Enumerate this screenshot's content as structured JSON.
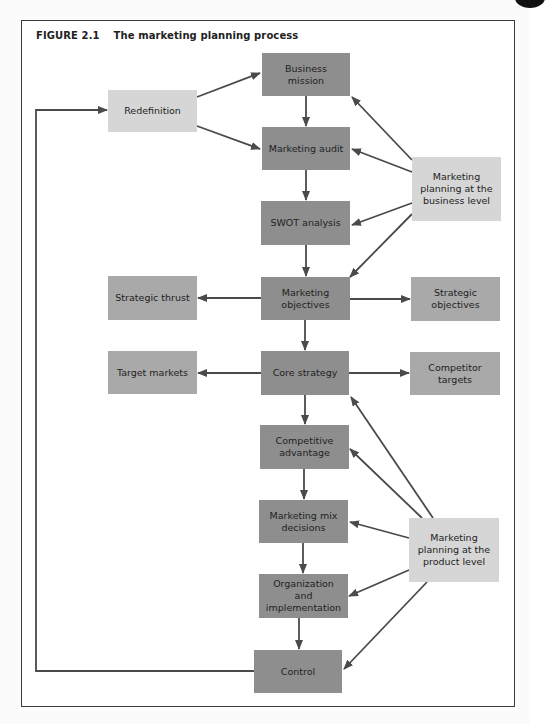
{
  "figure": {
    "number": "FIGURE 2.1",
    "title": "The marketing planning process"
  },
  "colors": {
    "core_box": "#8e8e8e",
    "side_box": "#a9a9a9",
    "light_box": "#d6d6d6",
    "arrow": "#4a4a4a",
    "frame": "#3a3a3a"
  },
  "nodes": {
    "business_mission": "Business mission",
    "marketing_audit": "Marketing audit",
    "swot_analysis": "SWOT analysis",
    "marketing_objectives": "Marketing objectives",
    "core_strategy": "Core strategy",
    "competitive_advantage": "Competitive advantage",
    "marketing_mix_decisions": "Marketing mix decisions",
    "organization_implementation": "Organization and implementation",
    "control": "Control",
    "redefinition": "Redefinition",
    "strategic_thrust": "Strategic thrust",
    "target_markets": "Target markets",
    "strategic_objectives": "Strategic objectives",
    "competitor_targets": "Competitor targets",
    "planning_business_level": "Marketing planning at the business level",
    "planning_product_level": "Marketing planning at the product level"
  },
  "edges": [
    {
      "from": "business_mission",
      "to": "marketing_audit"
    },
    {
      "from": "marketing_audit",
      "to": "swot_analysis"
    },
    {
      "from": "swot_analysis",
      "to": "marketing_objectives"
    },
    {
      "from": "marketing_objectives",
      "to": "core_strategy"
    },
    {
      "from": "core_strategy",
      "to": "competitive_advantage"
    },
    {
      "from": "competitive_advantage",
      "to": "marketing_mix_decisions"
    },
    {
      "from": "marketing_mix_decisions",
      "to": "organization_implementation"
    },
    {
      "from": "organization_implementation",
      "to": "control"
    },
    {
      "from": "control",
      "to": "redefinition"
    },
    {
      "from": "redefinition",
      "to": "business_mission"
    },
    {
      "from": "redefinition",
      "to": "marketing_audit"
    },
    {
      "from": "marketing_objectives",
      "to": "strategic_thrust"
    },
    {
      "from": "marketing_objectives",
      "to": "strategic_objectives"
    },
    {
      "from": "core_strategy",
      "to": "target_markets"
    },
    {
      "from": "core_strategy",
      "to": "competitor_targets"
    },
    {
      "from": "planning_business_level",
      "to": "business_mission"
    },
    {
      "from": "planning_business_level",
      "to": "marketing_audit"
    },
    {
      "from": "planning_business_level",
      "to": "swot_analysis"
    },
    {
      "from": "planning_business_level",
      "to": "marketing_objectives"
    },
    {
      "from": "planning_product_level",
      "to": "core_strategy"
    },
    {
      "from": "planning_product_level",
      "to": "competitive_advantage"
    },
    {
      "from": "planning_product_level",
      "to": "marketing_mix_decisions"
    },
    {
      "from": "planning_product_level",
      "to": "organization_implementation"
    },
    {
      "from": "planning_product_level",
      "to": "control"
    }
  ]
}
